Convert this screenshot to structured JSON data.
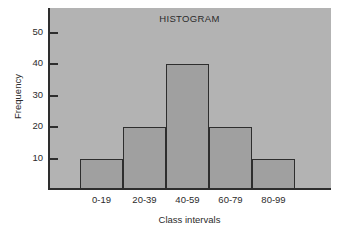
{
  "chart_data": {
    "type": "bar",
    "title": "HISTOGRAM",
    "xlabel": "Class intervals",
    "ylabel": "Frequency",
    "categories": [
      "0-19",
      "20-39",
      "40-59",
      "60-79",
      "80-99"
    ],
    "values": [
      10,
      20,
      40,
      20,
      10
    ],
    "ylim": [
      0,
      58
    ],
    "yticks": [
      10,
      20,
      30,
      40,
      50
    ],
    "ytick_labels": [
      "10",
      "20",
      "30",
      "40",
      "50"
    ],
    "grid": false,
    "legend": null,
    "colors": {
      "panel_background": "#b3b3b3",
      "bar_fill": "#a0a0a0",
      "bar_edge": "#2e2e2e",
      "axis": "#2e2e2e",
      "text": "#2b2b2b",
      "figure_background": "#ffffff"
    }
  }
}
